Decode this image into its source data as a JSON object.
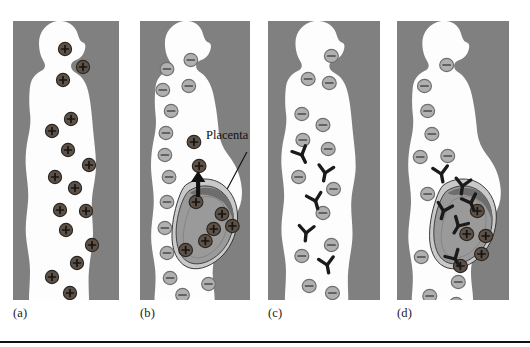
{
  "figure": {
    "width": 530,
    "height": 347,
    "background_color": "#ffffff",
    "panel_background_color": "#808080",
    "body_color": "#fdfdfd",
    "rh_positive_cell_color": "#5e5248",
    "rh_negative_cell_color": "#b0b0b0",
    "antibody_color": "#1a1a1a",
    "placenta_color": "#6d6d6d",
    "fetus_color": "#9a9a9a",
    "amnion_color": "#c9c9c9",
    "outline_color": "#2a2a2a",
    "rule_color": "#111111"
  },
  "annotations": {
    "placenta_label": "Placenta"
  },
  "panels": [
    {
      "id": "a",
      "label": "(a)",
      "x": 13,
      "y": 21,
      "width": 106,
      "height": 279,
      "label_x": 13,
      "label_y": 306,
      "pregnant": false,
      "maternal_cell_sign": "+",
      "maternal_cell_type": "rh-positive",
      "has_antibodies": false,
      "maternal_cells": [
        {
          "x": 52,
          "y": 28,
          "sign": "+",
          "type": "rh-positive"
        },
        {
          "x": 70,
          "y": 46,
          "sign": "+",
          "type": "rh-positive"
        },
        {
          "x": 50,
          "y": 59,
          "sign": "+",
          "type": "rh-positive"
        },
        {
          "x": 58,
          "y": 98,
          "sign": "+",
          "type": "rh-positive"
        },
        {
          "x": 39,
          "y": 110,
          "sign": "+",
          "type": "rh-positive"
        },
        {
          "x": 55,
          "y": 129,
          "sign": "+",
          "type": "rh-positive"
        },
        {
          "x": 76,
          "y": 144,
          "sign": "+",
          "type": "rh-positive"
        },
        {
          "x": 42,
          "y": 156,
          "sign": "+",
          "type": "rh-positive"
        },
        {
          "x": 62,
          "y": 167,
          "sign": "+",
          "type": "rh-positive"
        },
        {
          "x": 47,
          "y": 189,
          "sign": "+",
          "type": "rh-positive"
        },
        {
          "x": 73,
          "y": 190,
          "sign": "+",
          "type": "rh-positive"
        },
        {
          "x": 53,
          "y": 209,
          "sign": "+",
          "type": "rh-positive"
        },
        {
          "x": 79,
          "y": 224,
          "sign": "+",
          "type": "rh-positive"
        },
        {
          "x": 64,
          "y": 242,
          "sign": "+",
          "type": "rh-positive"
        },
        {
          "x": 39,
          "y": 256,
          "sign": "+",
          "type": "rh-positive"
        },
        {
          "x": 57,
          "y": 272,
          "sign": "+",
          "type": "rh-positive"
        }
      ],
      "fetal_cells": [],
      "antibodies": []
    },
    {
      "id": "b",
      "label": "(b)",
      "x": 140,
      "y": 21,
      "width": 110,
      "height": 279,
      "label_x": 140,
      "label_y": 306,
      "pregnant": true,
      "maternal_cell_sign": "-",
      "maternal_cell_type": "rh-negative",
      "has_antibodies": false,
      "maternal_cells": [
        {
          "x": 26,
          "y": 48,
          "sign": "-",
          "type": "rh-negative"
        },
        {
          "x": 49,
          "y": 39,
          "sign": "-",
          "type": "rh-negative"
        },
        {
          "x": 22,
          "y": 69,
          "sign": "-",
          "type": "rh-negative"
        },
        {
          "x": 47,
          "y": 65,
          "sign": "-",
          "type": "rh-negative"
        },
        {
          "x": 30,
          "y": 90,
          "sign": "-",
          "type": "rh-negative"
        },
        {
          "x": 25,
          "y": 112,
          "sign": "-",
          "type": "rh-negative"
        },
        {
          "x": 24,
          "y": 134,
          "sign": "-",
          "type": "rh-negative"
        },
        {
          "x": 28,
          "y": 156,
          "sign": "-",
          "type": "rh-negative"
        },
        {
          "x": 26,
          "y": 181,
          "sign": "-",
          "type": "rh-negative"
        },
        {
          "x": 24,
          "y": 207,
          "sign": "-",
          "type": "rh-negative"
        },
        {
          "x": 26,
          "y": 232,
          "sign": "-",
          "type": "rh-negative"
        },
        {
          "x": 29,
          "y": 257,
          "sign": "-",
          "type": "rh-negative"
        },
        {
          "x": 41,
          "y": 274,
          "sign": "-",
          "type": "rh-negative"
        },
        {
          "x": 66,
          "y": 263,
          "sign": "-",
          "type": "rh-negative"
        }
      ],
      "fetal_cells": [
        {
          "x": 52,
          "y": 121,
          "sign": "+",
          "type": "rh-positive"
        },
        {
          "x": 57,
          "y": 145,
          "sign": "+",
          "type": "rh-positive"
        },
        {
          "x": 54,
          "y": 181,
          "sign": "+",
          "type": "rh-positive"
        },
        {
          "x": 79,
          "y": 193,
          "sign": "+",
          "type": "rh-positive"
        },
        {
          "x": 89,
          "y": 205,
          "sign": "+",
          "type": "rh-positive"
        },
        {
          "x": 71,
          "y": 208,
          "sign": "+",
          "type": "rh-positive"
        },
        {
          "x": 63,
          "y": 220,
          "sign": "+",
          "type": "rh-positive"
        },
        {
          "x": 44,
          "y": 229,
          "sign": "+",
          "type": "rh-positive"
        }
      ],
      "antibodies": [],
      "placenta_arrow": true
    },
    {
      "id": "c",
      "label": "(c)",
      "x": 268,
      "y": 21,
      "width": 112,
      "height": 279,
      "label_x": 268,
      "label_y": 306,
      "pregnant": false,
      "maternal_cell_sign": "-",
      "maternal_cell_type": "rh-negative",
      "has_antibodies": true,
      "maternal_cells": [
        {
          "x": 60,
          "y": 35,
          "sign": "-",
          "type": "rh-negative"
        },
        {
          "x": 38,
          "y": 58,
          "sign": "-",
          "type": "rh-negative"
        },
        {
          "x": 58,
          "y": 62,
          "sign": "-",
          "type": "rh-negative"
        },
        {
          "x": 32,
          "y": 93,
          "sign": "-",
          "type": "rh-negative"
        },
        {
          "x": 52,
          "y": 104,
          "sign": "-",
          "type": "rh-negative"
        },
        {
          "x": 33,
          "y": 119,
          "sign": "-",
          "type": "rh-negative"
        },
        {
          "x": 57,
          "y": 128,
          "sign": "-",
          "type": "rh-negative"
        },
        {
          "x": 29,
          "y": 156,
          "sign": "-",
          "type": "rh-negative"
        },
        {
          "x": 62,
          "y": 168,
          "sign": "-",
          "type": "rh-negative"
        },
        {
          "x": 52,
          "y": 192,
          "sign": "-",
          "type": "rh-negative"
        },
        {
          "x": 60,
          "y": 224,
          "sign": "-",
          "type": "rh-negative"
        },
        {
          "x": 32,
          "y": 235,
          "sign": "-",
          "type": "rh-negative"
        },
        {
          "x": 39,
          "y": 265,
          "sign": "-",
          "type": "rh-negative"
        },
        {
          "x": 61,
          "y": 272,
          "sign": "-",
          "type": "rh-negative"
        }
      ],
      "fetal_cells": [],
      "antibodies": [
        {
          "x": 32,
          "y": 134,
          "rot": -25
        },
        {
          "x": 54,
          "y": 152,
          "rot": 10
        },
        {
          "x": 45,
          "y": 180,
          "rot": -15
        },
        {
          "x": 36,
          "y": 212,
          "rot": 5
        },
        {
          "x": 56,
          "y": 244,
          "rot": -10
        }
      ]
    },
    {
      "id": "d",
      "label": "(d)",
      "x": 397,
      "y": 21,
      "width": 112,
      "height": 279,
      "label_x": 397,
      "label_y": 306,
      "pregnant": true,
      "maternal_cell_sign": "-",
      "maternal_cell_type": "rh-negative",
      "has_antibodies": true,
      "maternal_cells": [
        {
          "x": 47,
          "y": 44,
          "sign": "-",
          "type": "rh-negative"
        },
        {
          "x": 26,
          "y": 65,
          "sign": "-",
          "type": "rh-negative"
        },
        {
          "x": 29,
          "y": 90,
          "sign": "-",
          "type": "rh-negative"
        },
        {
          "x": 33,
          "y": 113,
          "sign": "-",
          "type": "rh-negative"
        },
        {
          "x": 22,
          "y": 136,
          "sign": "-",
          "type": "rh-negative"
        },
        {
          "x": 48,
          "y": 135,
          "sign": "-",
          "type": "rh-negative"
        },
        {
          "x": 29,
          "y": 173,
          "sign": "-",
          "type": "rh-negative"
        },
        {
          "x": 23,
          "y": 236,
          "sign": "-",
          "type": "rh-negative"
        },
        {
          "x": 58,
          "y": 261,
          "sign": "-",
          "type": "rh-negative"
        },
        {
          "x": 31,
          "y": 275,
          "sign": "-",
          "type": "rh-negative"
        },
        {
          "x": 56,
          "y": 283,
          "sign": "-",
          "type": "rh-negative"
        }
      ],
      "fetal_cells": [
        {
          "x": 76,
          "y": 190,
          "sign": "+",
          "type": "rh-positive"
        },
        {
          "x": 66,
          "y": 213,
          "sign": "+",
          "type": "rh-positive"
        },
        {
          "x": 84,
          "y": 215,
          "sign": "+",
          "type": "rh-positive"
        },
        {
          "x": 80,
          "y": 233,
          "sign": "+",
          "type": "rh-positive"
        },
        {
          "x": 60,
          "y": 245,
          "sign": "+",
          "type": "rh-positive"
        }
      ],
      "antibodies": [
        {
          "x": 42,
          "y": 153,
          "rot": -10
        },
        {
          "x": 62,
          "y": 165,
          "rot": 8
        },
        {
          "x": 44,
          "y": 190,
          "rot": 15
        },
        {
          "x": 70,
          "y": 182,
          "rot": -20
        },
        {
          "x": 58,
          "y": 205,
          "rot": 30
        },
        {
          "x": 55,
          "y": 238,
          "rot": -30
        }
      ]
    }
  ]
}
